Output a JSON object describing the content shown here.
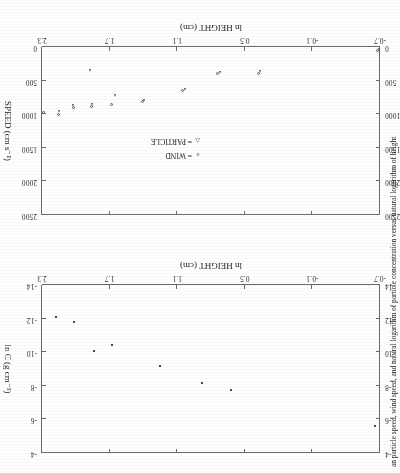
{
  "figure": {
    "caption": "an particle speed, wind speed, and natural logarithm of particle concentration versus natural logarithm of height",
    "rotation_degrees": 180
  },
  "charts": [
    {
      "id": "speed-vs-height",
      "position": "bottom",
      "xlabel": "ln HEIGHT (cm)",
      "ylabel": "SPEED (cm s−1)",
      "xticks": [
        "2.3",
        "1.7",
        "1.1",
        "0.5",
        "-0.1",
        "-0.7"
      ],
      "yticks": [
        "0",
        "500",
        "1000",
        "1500",
        "2000",
        "2500"
      ],
      "legend": [
        {
          "symbol": "o",
          "eq": "=",
          "label": "WIND"
        },
        {
          "symbol": "△",
          "eq": "=",
          "label": "PARTICLE"
        }
      ]
    },
    {
      "id": "lnc-vs-height",
      "position": "top",
      "xlabel": "ln HEIGHT (cm)",
      "ylabel": "ln C (g cm−3)",
      "xticks": [
        "2.3",
        "1.7",
        "1.1",
        "0.5",
        "-0.1",
        "-0.7"
      ],
      "yticks": [
        "-4",
        "-6",
        "-8",
        "-10",
        "-12",
        "-14"
      ]
    }
  ],
  "chart_data": [
    {
      "type": "scatter",
      "id": "lnc-vs-height",
      "title": "",
      "xlabel": "ln HEIGHT (cm)",
      "ylabel": "ln C (g cm^-3)",
      "xlim": [
        -0.7,
        2.3
      ],
      "ylim": [
        -14,
        -4
      ],
      "xticks": [
        2.3,
        1.7,
        1.1,
        0.5,
        -0.1,
        -0.7
      ],
      "yticks": [
        -4,
        -6,
        -8,
        -10,
        -12,
        -14
      ],
      "grid": false,
      "legend": null,
      "series": [
        {
          "name": "ln C",
          "marker": "square",
          "points": [
            {
              "x": 2.18,
              "y": -12.1
            },
            {
              "x": 2.02,
              "y": -11.8
            },
            {
              "x": 1.84,
              "y": -10.1
            },
            {
              "x": 1.68,
              "y": -10.45
            },
            {
              "x": 1.25,
              "y": -9.2
            },
            {
              "x": 0.88,
              "y": -8.15
            },
            {
              "x": 0.62,
              "y": -7.75
            },
            {
              "x": -0.66,
              "y": -5.6
            }
          ]
        }
      ]
    },
    {
      "type": "scatter",
      "id": "speed-vs-height",
      "title": "",
      "xlabel": "ln HEIGHT (cm)",
      "ylabel": "SPEED (cm s^-1)",
      "xlim": [
        -0.7,
        2.3
      ],
      "ylim": [
        0,
        2500
      ],
      "xticks": [
        2.3,
        1.7,
        1.1,
        0.5,
        -0.1,
        -0.7
      ],
      "yticks": [
        0,
        500,
        1000,
        1500,
        2000,
        2500
      ],
      "grid": false,
      "legend": "inside-right",
      "series": [
        {
          "name": "WIND",
          "marker": "circle",
          "points": [
            {
              "x": 2.29,
              "y": 980
            },
            {
              "x": 2.15,
              "y": 1010
            },
            {
              "x": 2.02,
              "y": 900
            },
            {
              "x": 1.86,
              "y": 885
            },
            {
              "x": 1.68,
              "y": 855
            },
            {
              "x": 1.41,
              "y": 810
            },
            {
              "x": 1.05,
              "y": 640
            },
            {
              "x": 0.74,
              "y": 400
            },
            {
              "x": 0.38,
              "y": 400
            },
            {
              "x": -0.68,
              "y": 55
            }
          ]
        },
        {
          "name": "PARTICLE",
          "marker": "triangle",
          "points": [
            {
              "x": 2.16,
              "y": 955
            },
            {
              "x": 2.03,
              "y": 870
            },
            {
              "x": 1.86,
              "y": 855
            },
            {
              "x": 1.66,
              "y": 715
            },
            {
              "x": 1.4,
              "y": 790
            },
            {
              "x": 1.04,
              "y": 625
            },
            {
              "x": 1.88,
              "y": 355
            },
            {
              "x": 0.73,
              "y": 380
            },
            {
              "x": 0.37,
              "y": 370
            },
            {
              "x": -0.68,
              "y": 35
            }
          ]
        }
      ]
    }
  ]
}
